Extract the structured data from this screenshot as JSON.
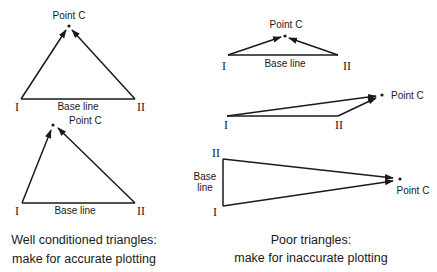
{
  "labels": {
    "point_c": "Point C",
    "base_line": "Base line",
    "base_word": "Base",
    "line_word": "line",
    "station_one": "I",
    "station_two": "II"
  },
  "well_conditioned": {
    "caption_line1": "Well conditioned triangles:",
    "caption_line2": "make for accurate plotting",
    "triangles": [
      {
        "id": "tri-1",
        "I": [
          21,
          99
        ],
        "II": [
          135,
          99
        ],
        "C": [
          69,
          26
        ]
      },
      {
        "id": "tri-2",
        "I": [
          22,
          203
        ],
        "II": [
          135,
          203
        ],
        "C": [
          53,
          125
        ]
      }
    ]
  },
  "poor": {
    "caption_line1": "Poor triangles:",
    "caption_line2": "make for inaccurate plotting",
    "triangles": [
      {
        "id": "tri-3",
        "I": [
          228,
          55
        ],
        "II": [
          338,
          55
        ],
        "C": [
          285,
          36
        ]
      },
      {
        "id": "tri-4",
        "I": [
          227,
          116
        ],
        "II": [
          338,
          116
        ],
        "C": [
          382,
          95
        ]
      },
      {
        "id": "tri-5",
        "I": [
          223,
          206
        ],
        "II": [
          223,
          159
        ],
        "C": [
          400,
          179
        ]
      }
    ]
  },
  "colors": {
    "ink": "#1a1a1a",
    "background": "#ffffff"
  }
}
